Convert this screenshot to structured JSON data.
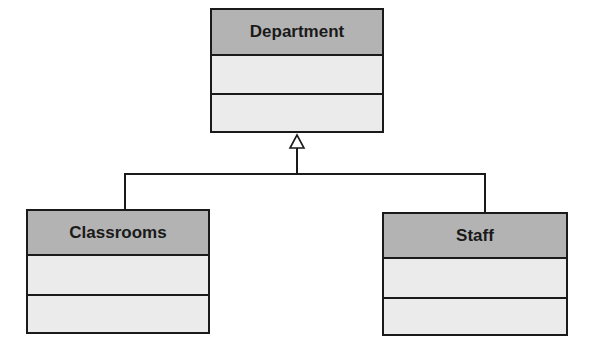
{
  "diagram": {
    "type": "uml-class-inheritance",
    "classes": [
      {
        "id": "parent",
        "name": "Department",
        "attributes": [],
        "methods": []
      },
      {
        "id": "child1",
        "name": "Classrooms",
        "attributes": [],
        "methods": []
      },
      {
        "id": "child2",
        "name": "Staff",
        "attributes": [],
        "methods": []
      }
    ],
    "relationships": [
      {
        "from": "Classrooms",
        "to": "Department",
        "type": "generalization"
      },
      {
        "from": "Staff",
        "to": "Department",
        "type": "generalization"
      }
    ],
    "colors": {
      "header": "#b3b3b3",
      "body": "#ebebeb",
      "line": "#1a1a1a"
    }
  }
}
